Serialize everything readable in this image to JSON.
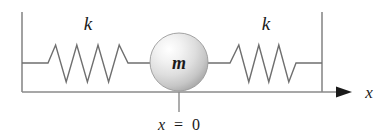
{
  "figure": {
    "background_color": "#ffffff",
    "line_color": "#8a8a8a",
    "text_color": "#1a1a1a"
  },
  "labels": {
    "spring_left": "k",
    "spring_right": "k",
    "mass": "m",
    "axis": "x",
    "origin_variable": "x",
    "origin_equals": "=",
    "origin_value": "0",
    "origin_full": "x = 0"
  },
  "geometry": {
    "wall_left_x": 22,
    "wall_right_x": 322,
    "wall_top_y": 12,
    "baseline_y": 92,
    "spring_axis_y": 63,
    "mass_center_x": 179,
    "mass_center_y": 62,
    "mass_radius": 29,
    "axis_arrow_tip_x": 352,
    "origin_tick_top_y": 92,
    "origin_tick_bottom_y": 112
  },
  "springs": {
    "coil_count": 4,
    "peak_y": 45,
    "valley_y": 82,
    "left": {
      "start_x": 48,
      "end_x": 133
    },
    "right": {
      "start_x": 225,
      "end_x": 300
    }
  },
  "mass_sphere": {
    "highlight_color": "#ffffff",
    "mid_color": "#dcdcdc",
    "edge_color": "#9a9a9a"
  },
  "label_positions": {
    "k_left_x": 88,
    "k_left_y": 30,
    "k_right_x": 266,
    "k_right_y": 30,
    "m_x": 179,
    "m_y": 69,
    "axis_x": 369,
    "axis_y": 98,
    "origin_x": 179,
    "origin_y": 130
  }
}
